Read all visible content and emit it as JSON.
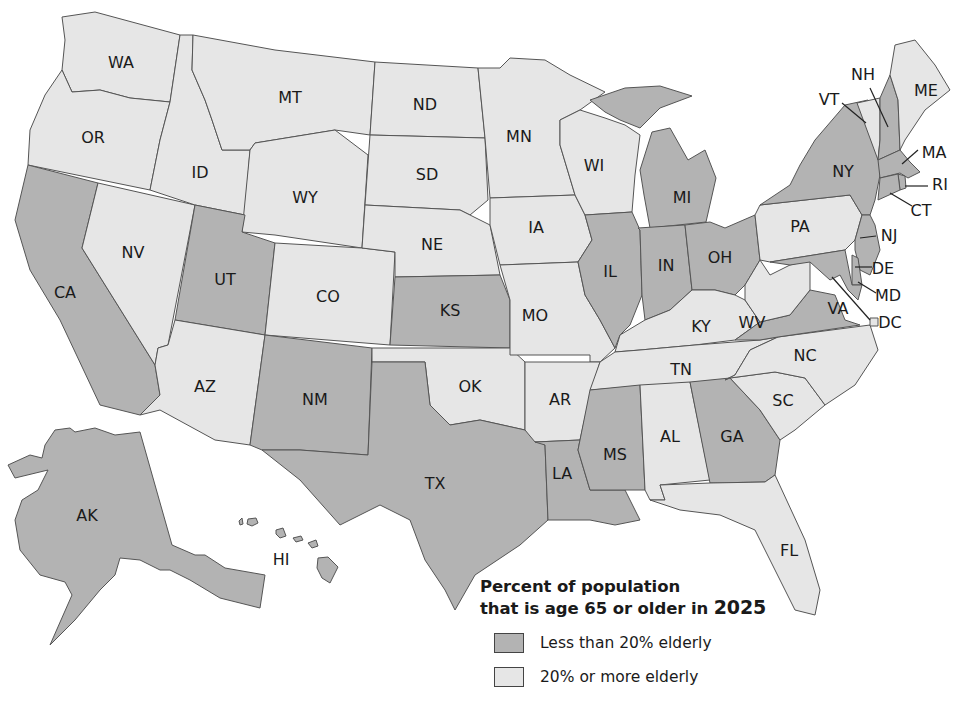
{
  "colors": {
    "under_20": "#b3b3b3",
    "over_20": "#e6e6e6",
    "border": "#555555"
  },
  "legend": {
    "title_line1": "Percent of population",
    "title_line2_prefix": "that is age 65 or older in ",
    "title_year": "2025",
    "items": [
      {
        "label": "Less than 20% elderly",
        "category": "under_20"
      },
      {
        "label": "20% or more elderly",
        "category": "over_20"
      }
    ]
  },
  "states": [
    {
      "abbr": "WA",
      "category": "over_20"
    },
    {
      "abbr": "OR",
      "category": "over_20"
    },
    {
      "abbr": "CA",
      "category": "under_20"
    },
    {
      "abbr": "NV",
      "category": "over_20"
    },
    {
      "abbr": "ID",
      "category": "over_20"
    },
    {
      "abbr": "MT",
      "category": "over_20"
    },
    {
      "abbr": "WY",
      "category": "over_20"
    },
    {
      "abbr": "UT",
      "category": "under_20"
    },
    {
      "abbr": "AZ",
      "category": "over_20"
    },
    {
      "abbr": "CO",
      "category": "over_20"
    },
    {
      "abbr": "NM",
      "category": "under_20"
    },
    {
      "abbr": "ND",
      "category": "over_20"
    },
    {
      "abbr": "SD",
      "category": "over_20"
    },
    {
      "abbr": "NE",
      "category": "over_20"
    },
    {
      "abbr": "KS",
      "category": "under_20"
    },
    {
      "abbr": "OK",
      "category": "over_20"
    },
    {
      "abbr": "TX",
      "category": "under_20"
    },
    {
      "abbr": "MN",
      "category": "over_20"
    },
    {
      "abbr": "IA",
      "category": "over_20"
    },
    {
      "abbr": "MO",
      "category": "over_20"
    },
    {
      "abbr": "AR",
      "category": "over_20"
    },
    {
      "abbr": "LA",
      "category": "under_20"
    },
    {
      "abbr": "WI",
      "category": "over_20"
    },
    {
      "abbr": "IL",
      "category": "under_20"
    },
    {
      "abbr": "MI",
      "category": "under_20"
    },
    {
      "abbr": "IN",
      "category": "under_20"
    },
    {
      "abbr": "OH",
      "category": "under_20"
    },
    {
      "abbr": "KY",
      "category": "over_20"
    },
    {
      "abbr": "TN",
      "category": "over_20"
    },
    {
      "abbr": "MS",
      "category": "under_20"
    },
    {
      "abbr": "AL",
      "category": "over_20"
    },
    {
      "abbr": "GA",
      "category": "under_20"
    },
    {
      "abbr": "FL",
      "category": "over_20"
    },
    {
      "abbr": "SC",
      "category": "over_20"
    },
    {
      "abbr": "NC",
      "category": "over_20"
    },
    {
      "abbr": "VA",
      "category": "under_20"
    },
    {
      "abbr": "WV",
      "category": "over_20"
    },
    {
      "abbr": "PA",
      "category": "over_20"
    },
    {
      "abbr": "NY",
      "category": "under_20"
    },
    {
      "abbr": "VT",
      "category": "over_20"
    },
    {
      "abbr": "NH",
      "category": "under_20"
    },
    {
      "abbr": "ME",
      "category": "over_20"
    },
    {
      "abbr": "MA",
      "category": "under_20"
    },
    {
      "abbr": "RI",
      "category": "under_20"
    },
    {
      "abbr": "CT",
      "category": "under_20"
    },
    {
      "abbr": "NJ",
      "category": "under_20"
    },
    {
      "abbr": "DE",
      "category": "under_20"
    },
    {
      "abbr": "MD",
      "category": "under_20"
    },
    {
      "abbr": "DC",
      "category": "over_20"
    },
    {
      "abbr": "AK",
      "category": "under_20"
    },
    {
      "abbr": "HI",
      "category": "under_20"
    }
  ]
}
